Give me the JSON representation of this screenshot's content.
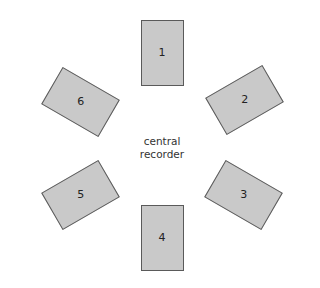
{
  "diagram": {
    "type": "hexagonal-arrangement",
    "center_label_lines": [
      "central",
      "recorder"
    ],
    "colors": {
      "unit_fill": "#c9c9c9",
      "unit_border": "#5a5a5a",
      "text": "#222222",
      "background": "#ffffff"
    },
    "units": [
      {
        "label": "1",
        "cx": 162,
        "cy": 52.5,
        "rotate": 0
      },
      {
        "label": "2",
        "cx": 244,
        "cy": 100,
        "rotate": 60
      },
      {
        "label": "3",
        "cx": 243,
        "cy": 195,
        "rotate": -60
      },
      {
        "label": "4",
        "cx": 162,
        "cy": 238,
        "rotate": 0
      },
      {
        "label": "5",
        "cx": 80,
        "cy": 194.5,
        "rotate": 60
      },
      {
        "label": "6",
        "cx": 80,
        "cy": 101.5,
        "rotate": -60
      }
    ]
  }
}
